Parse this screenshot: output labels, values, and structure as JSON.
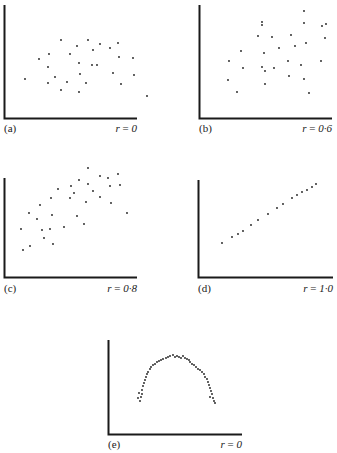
{
  "chart_data": [
    {
      "type": "scatter",
      "panel": "(a)",
      "annotation": "r=0",
      "r": 0,
      "axes": {
        "x0": 4,
        "y0": 118,
        "x1": 137,
        "ytop": 5
      },
      "points": [
        [
          25,
          79
        ],
        [
          39,
          59
        ],
        [
          49,
          54
        ],
        [
          61,
          40
        ],
        [
          88,
          40
        ],
        [
          77,
          46
        ],
        [
          100,
          44
        ],
        [
          110,
          48
        ],
        [
          118,
          43
        ],
        [
          70,
          54
        ],
        [
          48,
          67
        ],
        [
          55,
          77
        ],
        [
          79,
          63
        ],
        [
          92,
          65
        ],
        [
          97,
          65
        ],
        [
          133,
          58
        ],
        [
          119,
          57
        ],
        [
          48,
          83
        ],
        [
          61,
          90
        ],
        [
          67,
          82
        ],
        [
          80,
          74
        ],
        [
          79,
          92
        ],
        [
          86,
          83
        ],
        [
          113,
          73
        ],
        [
          134,
          75
        ],
        [
          121,
          84
        ],
        [
          147,
          96
        ],
        [
          93,
          50
        ]
      ]
    },
    {
      "type": "scatter",
      "panel": "(b)",
      "annotation": "r=0·6",
      "r": 0.6,
      "axes": {
        "x0": 199,
        "y0": 118,
        "x1": 332,
        "ytop": 5
      },
      "points": [
        [
          304,
          11
        ],
        [
          262,
          22
        ],
        [
          304,
          23
        ],
        [
          322,
          26
        ],
        [
          326,
          24
        ],
        [
          262,
          25
        ],
        [
          258,
          36
        ],
        [
          272,
          37
        ],
        [
          291,
          35
        ],
        [
          325,
          38
        ],
        [
          295,
          46
        ],
        [
          306,
          43
        ],
        [
          279,
          48
        ],
        [
          241,
          51
        ],
        [
          264,
          53
        ],
        [
          229,
          61
        ],
        [
          288,
          61
        ],
        [
          321,
          61
        ],
        [
          301,
          65
        ],
        [
          243,
          68
        ],
        [
          262,
          67
        ],
        [
          265,
          71
        ],
        [
          274,
          68
        ],
        [
          289,
          76
        ],
        [
          304,
          79
        ],
        [
          228,
          80
        ],
        [
          265,
          84
        ],
        [
          237,
          92
        ],
        [
          309,
          93
        ]
      ]
    },
    {
      "type": "scatter",
      "panel": "(c)",
      "annotation": "r=0·8",
      "r": 0.8,
      "axes": {
        "x0": 4,
        "y0": 277,
        "x1": 137,
        "ytop": 178
      },
      "points": [
        [
          88,
          168
        ],
        [
          100,
          176
        ],
        [
          108,
          178
        ],
        [
          118,
          174
        ],
        [
          79,
          180
        ],
        [
          71,
          186
        ],
        [
          88,
          184
        ],
        [
          110,
          186
        ],
        [
          120,
          185
        ],
        [
          58,
          189
        ],
        [
          74,
          193
        ],
        [
          93,
          191
        ],
        [
          51,
          198
        ],
        [
          70,
          198
        ],
        [
          86,
          202
        ],
        [
          100,
          197
        ],
        [
          111,
          203
        ],
        [
          40,
          205
        ],
        [
          29,
          213
        ],
        [
          52,
          215
        ],
        [
          77,
          216
        ],
        [
          37,
          219
        ],
        [
          127,
          213
        ],
        [
          21,
          229
        ],
        [
          42,
          230
        ],
        [
          50,
          229
        ],
        [
          64,
          227
        ],
        [
          84,
          224
        ],
        [
          44,
          238
        ],
        [
          53,
          244
        ],
        [
          30,
          246
        ],
        [
          23,
          250
        ]
      ]
    },
    {
      "type": "scatter",
      "panel": "(d)",
      "annotation": "r=1·0",
      "r": 1.0,
      "axes": {
        "x0": 198,
        "y0": 277,
        "x1": 333,
        "ytop": 180
      },
      "points": [
        [
          222,
          243
        ],
        [
          232,
          237
        ],
        [
          238,
          234
        ],
        [
          243,
          231
        ],
        [
          251,
          225
        ],
        [
          258,
          220
        ],
        [
          268,
          214
        ],
        [
          277,
          208
        ],
        [
          283,
          204
        ],
        [
          292,
          198
        ],
        [
          297,
          195
        ],
        [
          302,
          192
        ],
        [
          307,
          190
        ],
        [
          312,
          187
        ],
        [
          316,
          184
        ]
      ]
    },
    {
      "type": "scatter",
      "panel": "(e)",
      "annotation": "r=0",
      "r": 0,
      "axes": {
        "x0": 108,
        "y0": 434,
        "x1": 242,
        "ytop": 340
      },
      "points": [
        [
          140,
          401
        ],
        [
          141,
          397
        ],
        [
          142,
          394
        ],
        [
          142,
          390
        ],
        [
          143,
          386
        ],
        [
          144,
          383
        ],
        [
          145,
          380
        ],
        [
          146,
          377
        ],
        [
          147,
          374
        ],
        [
          148,
          372
        ],
        [
          150,
          369
        ],
        [
          151,
          367
        ],
        [
          153,
          365
        ],
        [
          155,
          364
        ],
        [
          157,
          362
        ],
        [
          159,
          361
        ],
        [
          161,
          360
        ],
        [
          163,
          359
        ],
        [
          166,
          358
        ],
        [
          168,
          357
        ],
        [
          170,
          356
        ],
        [
          173,
          355
        ],
        [
          175,
          357
        ],
        [
          177,
          356
        ],
        [
          179,
          357
        ],
        [
          181,
          358
        ],
        [
          183,
          356
        ],
        [
          185,
          358
        ],
        [
          187,
          359
        ],
        [
          189,
          360
        ],
        [
          190,
          362
        ],
        [
          192,
          364
        ],
        [
          194,
          365
        ],
        [
          196,
          367
        ],
        [
          198,
          369
        ],
        [
          200,
          370
        ],
        [
          202,
          372
        ],
        [
          204,
          374
        ],
        [
          205,
          377
        ],
        [
          207,
          379
        ],
        [
          208,
          382
        ],
        [
          209,
          385
        ],
        [
          210,
          388
        ],
        [
          211,
          391
        ],
        [
          212,
          394
        ],
        [
          213,
          398
        ],
        [
          214,
          401
        ],
        [
          215,
          403
        ],
        [
          138,
          398
        ],
        [
          139,
          393
        ],
        [
          210,
          397
        ]
      ]
    }
  ],
  "panels": {
    "a": {
      "label": "(a)",
      "r_text": "r = 0"
    },
    "b": {
      "label": "(b)",
      "r_text": "r = 0·6"
    },
    "c": {
      "label": "(c)",
      "r_text": "r = 0·8"
    },
    "d": {
      "label": "(d)",
      "r_text": "r = 1·0"
    },
    "e": {
      "label": "(e)",
      "r_text": "r = 0"
    }
  },
  "style": {
    "ink": "#1a1a1a",
    "background": "#ffffff"
  }
}
